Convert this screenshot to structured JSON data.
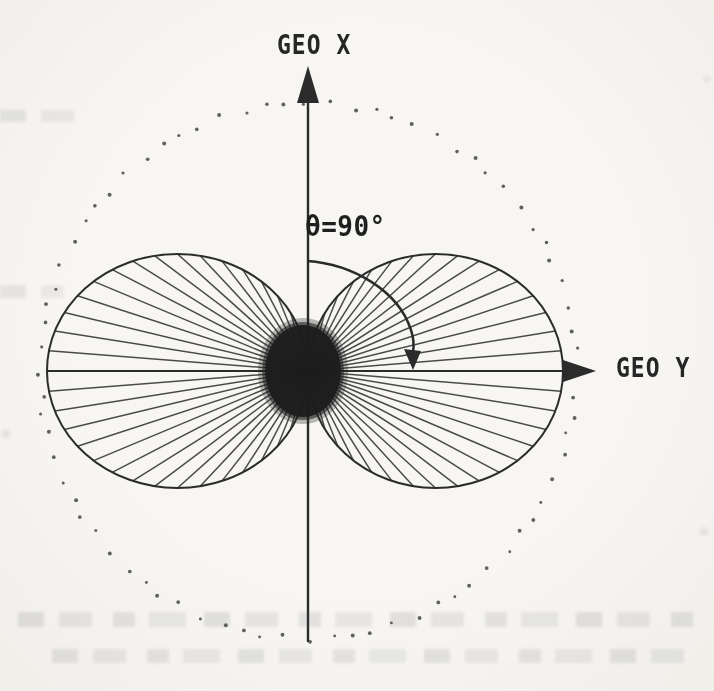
{
  "figure": {
    "type": "dipole-radiation-pattern-diagram",
    "labels": {
      "geo_x": "GEO X",
      "geo_y": "GEO Y",
      "theta": "θ=90°"
    },
    "geometry": {
      "origin": {
        "x": 308,
        "y": 371
      },
      "dotted_circle": {
        "radius": 268,
        "dot_count": 76
      },
      "lobes": {
        "left_span": 261,
        "right_span": 255,
        "ry": 117,
        "ray_step_deg": 5,
        "ray_max_deg": 85
      },
      "center_blob": {
        "cx": 303,
        "cy": 371,
        "rx": 38,
        "ry": 46
      },
      "x_axis": {
        "tip_y": 66,
        "head_base_y": 103,
        "head_half_w": 11,
        "bottom_y": 642
      },
      "y_axis": {
        "left_x": 47,
        "shaft_end_x": 570,
        "head_base_x": 563,
        "tip_x": 596,
        "head_half_h": 11
      },
      "theta_arc": {
        "path": "M 307 261 C 352 264 398 290 411 330 C 414 339 414 346 413 352",
        "arrow": "413,370 404,349 421,351"
      }
    },
    "colors": {
      "ink": "#2b2b2b",
      "ray": "#333333",
      "dot": "#454545",
      "paper": "#f5f4f1"
    }
  },
  "chart_data": {
    "type": "polar",
    "r_law": "r ∝ |sin θ|, θ measured from the GEO X axis",
    "axes": {
      "vertical": "GEO X",
      "horizontal": "GEO Y"
    },
    "annotations": [
      "θ=90°"
    ],
    "ray_step_deg": 5,
    "reference_circle": "dotted circle of maximum radius",
    "lobe_directions": [
      "+GEO Y",
      "-GEO Y"
    ]
  }
}
